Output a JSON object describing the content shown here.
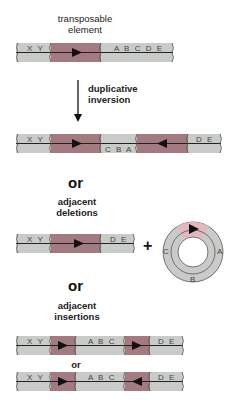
{
  "labels": {
    "transposable_element": "transposable element",
    "duplicative_inversion": "duplicative inversion",
    "or_1": "or",
    "adjacent_deletions": "adjacent deletions",
    "plus": "+",
    "or_2": "or",
    "adjacent_insertions": "adjacent insertions",
    "or_3": "or"
  },
  "colors": {
    "dna": "#c9cbc9",
    "transposon": "#a27a80",
    "transposon_light": "#e3b8bc",
    "line": "#222222"
  },
  "rows": {
    "original": {
      "left": "X Y",
      "right": "A B C D E",
      "element_direction": "right"
    },
    "inversion": {
      "left": "X Y",
      "middle": "C B A",
      "right": "D E",
      "element1_direction": "right",
      "element2_direction": "left"
    },
    "deletion": {
      "left": "X Y",
      "right": "D E",
      "element_direction": "right"
    },
    "circle": {
      "labels": [
        "A",
        "B",
        "C"
      ],
      "element_direction": "right"
    },
    "insertion_a": {
      "left": "X Y",
      "middle": "A B C",
      "right": "D E",
      "element1_direction": "right",
      "element2_direction": "right"
    },
    "insertion_b": {
      "left": "X Y",
      "middle": "A B C",
      "right": "D E",
      "element1_direction": "right",
      "element2_direction": "left"
    }
  }
}
